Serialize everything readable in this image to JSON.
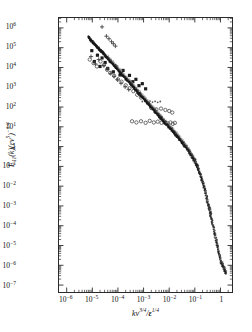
{
  "figure": {
    "background": "#ffffff",
    "frame_color": "#2a2a2a",
    "curve_color": "#1a1a1a",
    "symbol_color": "#3a3a3a"
  },
  "axes": {
    "x": {
      "title_parts": {
        "k": "k",
        "nu": "ν",
        "nu_exp": "3/4",
        "slash": "/",
        "eps": "ε",
        "eps_exp": "1/4"
      },
      "title_plain": "kν^(3/4)/ε^(1/4)",
      "tick_labels": [
        "10−6",
        "10−5",
        "10−4",
        "10−3",
        "10−2",
        "10−1",
        "1"
      ],
      "tick_exponents": [
        -6,
        -5,
        -4,
        -3,
        -2,
        -1,
        0
      ],
      "min": -6.3,
      "max": 0.45,
      "scale": "log"
    },
    "y": {
      "title_plain": "E11(k)(εν^5)^(−1/4)",
      "title_parts": {
        "E": "E",
        "sub": "11",
        "k": "(k)(",
        "eps": "ε",
        "nu": "ν",
        "nu_exp": "5",
        "close": ")",
        "outer_exp": "−1/4"
      },
      "tick_labels": [
        "10−7",
        "10−6",
        "10−5",
        "10−4",
        "10−3",
        "10−2",
        "10−1",
        "1",
        "10¹",
        "10²",
        "10³",
        "10⁴",
        "10⁵",
        "10⁶",
        "10⁷"
      ],
      "tick_exponents": [
        -6,
        -5,
        -4,
        -3,
        -2,
        -1,
        0,
        1,
        2,
        3,
        4,
        5,
        6,
        7
      ],
      "min": -6.35,
      "max": 7.5,
      "scale": "log"
    }
  },
  "chart_data": {
    "type": "scatter",
    "title": "",
    "xlabel": "kν^(3/4)/ε^(1/4)",
    "ylabel": "E11(k)(εν^5)^(−1/4)",
    "xlim": [
      -6.3,
      0.45
    ],
    "ylim": [
      -6.35,
      7.5
    ],
    "xscale": "log",
    "yscale": "log",
    "grid": false,
    "legend": "none",
    "universal_curve": {
      "name": "universal collapsed spectrum",
      "log_x": [
        -5.0,
        -4.75,
        -4.5,
        -4.25,
        -4.0,
        -3.75,
        -3.5,
        -3.25,
        -3.0,
        -2.75,
        -2.5,
        -2.25,
        -2.0,
        -1.8,
        -1.6,
        -1.4,
        -1.2,
        -1.05,
        -0.9,
        -0.75,
        -0.6,
        -0.45,
        -0.3,
        -0.2,
        -0.1,
        0.0,
        0.08,
        0.15,
        0.2
      ],
      "log_y": [
        6.3,
        5.95,
        5.62,
        5.25,
        4.9,
        4.52,
        4.18,
        3.8,
        3.45,
        3.08,
        2.72,
        2.35,
        2.0,
        1.7,
        1.4,
        1.08,
        0.72,
        0.4,
        0.0,
        -0.55,
        -1.25,
        -2.05,
        -2.95,
        -3.55,
        -4.15,
        -4.72,
        -5.0,
        -5.2,
        -5.35
      ],
      "slope_inertial": -1.6667
    },
    "symbol_groups": [
      {
        "name": "filled-squares",
        "marker": "filled-square",
        "points": [
          [
            -5.02,
            5.85
          ],
          [
            -4.92,
            5.3
          ],
          [
            -4.8,
            5.62
          ],
          [
            -4.7,
            5.05
          ],
          [
            -4.62,
            5.48
          ],
          [
            -4.5,
            5.25
          ],
          [
            -4.4,
            4.95
          ],
          [
            -4.3,
            5.32
          ],
          [
            -4.18,
            4.78
          ],
          [
            -4.05,
            5.02
          ],
          [
            -3.92,
            4.62
          ],
          [
            -3.8,
            4.85
          ],
          [
            -3.68,
            4.42
          ],
          [
            -3.55,
            4.6
          ],
          [
            -3.42,
            4.28
          ],
          [
            -3.3,
            4.4
          ],
          [
            -3.18,
            4.08
          ],
          [
            -3.05,
            4.18
          ],
          [
            -2.92,
            3.92
          ]
        ]
      },
      {
        "name": "plus-signs",
        "marker": "plus",
        "points": [
          [
            -4.62,
            7.05
          ],
          [
            -4.45,
            6.58
          ],
          [
            -4.35,
            6.45
          ],
          [
            -4.25,
            6.3
          ],
          [
            -4.18,
            6.2
          ],
          [
            -4.1,
            6.08
          ],
          [
            -5.05,
            5.55
          ],
          [
            -4.88,
            5.18
          ],
          [
            -4.75,
            5.4
          ],
          [
            -4.55,
            5.1
          ],
          [
            -4.42,
            4.92
          ],
          [
            -4.28,
            4.7
          ],
          [
            -4.15,
            4.55
          ],
          [
            -4.02,
            4.38
          ],
          [
            -3.88,
            4.2
          ],
          [
            -3.72,
            4.02
          ],
          [
            -3.58,
            3.88
          ]
        ]
      },
      {
        "name": "open-circles-upper",
        "marker": "open-circle",
        "points": [
          [
            -5.1,
            5.4
          ],
          [
            -4.95,
            5.22
          ],
          [
            -4.82,
            5.05
          ],
          [
            -4.68,
            5.3
          ],
          [
            -4.55,
            5.12
          ],
          [
            -4.42,
            4.88
          ],
          [
            -4.3,
            4.72
          ],
          [
            -4.15,
            4.58
          ],
          [
            -4.0,
            4.4
          ],
          [
            -3.86,
            4.28
          ],
          [
            -3.7,
            4.1
          ],
          [
            -3.55,
            3.95
          ],
          [
            -3.4,
            3.8
          ],
          [
            -3.25,
            3.62
          ],
          [
            -3.1,
            3.48
          ]
        ]
      },
      {
        "name": "open-circles-lower",
        "marker": "open-circle",
        "points": [
          [
            -3.45,
            2.28
          ],
          [
            -3.28,
            2.22
          ],
          [
            -3.1,
            2.28
          ],
          [
            -2.92,
            2.2
          ],
          [
            -2.76,
            2.3
          ],
          [
            -2.6,
            2.22
          ],
          [
            -2.45,
            2.26
          ],
          [
            -2.3,
            2.2
          ],
          [
            -2.18,
            2.24
          ],
          [
            -2.06,
            2.18
          ],
          [
            -1.95,
            2.22
          ],
          [
            -1.86,
            2.15
          ],
          [
            -1.78,
            2.2
          ]
        ]
      },
      {
        "name": "open-circles-mid",
        "marker": "open-circle",
        "points": [
          [
            -2.7,
            2.95
          ],
          [
            -2.5,
            2.88
          ],
          [
            -2.32,
            2.92
          ],
          [
            -2.15,
            2.85
          ],
          [
            -2.0,
            2.8
          ],
          [
            -1.88,
            2.72
          ]
        ]
      },
      {
        "name": "dense-text-cluster",
        "marker": "small-dot",
        "points": [
          [
            -3.05,
            3.28
          ],
          [
            -2.95,
            3.3
          ],
          [
            -2.85,
            3.26
          ],
          [
            -2.75,
            3.3
          ],
          [
            -2.65,
            3.25
          ],
          [
            -2.55,
            3.29
          ],
          [
            -2.45,
            3.24
          ],
          [
            -2.35,
            3.28
          ]
        ]
      }
    ]
  }
}
